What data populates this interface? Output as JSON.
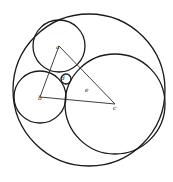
{
  "diagram": {
    "colors": {
      "stroke": "#1a1a1a",
      "background": "#ffffff"
    },
    "circles": [
      {
        "id": "outer",
        "cx": 89,
        "cy": 90,
        "r": 76
      },
      {
        "id": "a",
        "cx": 59,
        "cy": 46,
        "r": 26
      },
      {
        "id": "b",
        "cx": 40,
        "cy": 97,
        "r": 26
      },
      {
        "id": "c",
        "cx": 115,
        "cy": 104,
        "r": 50
      },
      {
        "id": "d",
        "cx": 66,
        "cy": 79,
        "r": 5
      }
    ],
    "triangle": {
      "vertices": [
        "a",
        "b",
        "c"
      ]
    },
    "labels": {
      "a": "a",
      "b": "b",
      "c": "c",
      "d": "d",
      "e": "e"
    }
  }
}
